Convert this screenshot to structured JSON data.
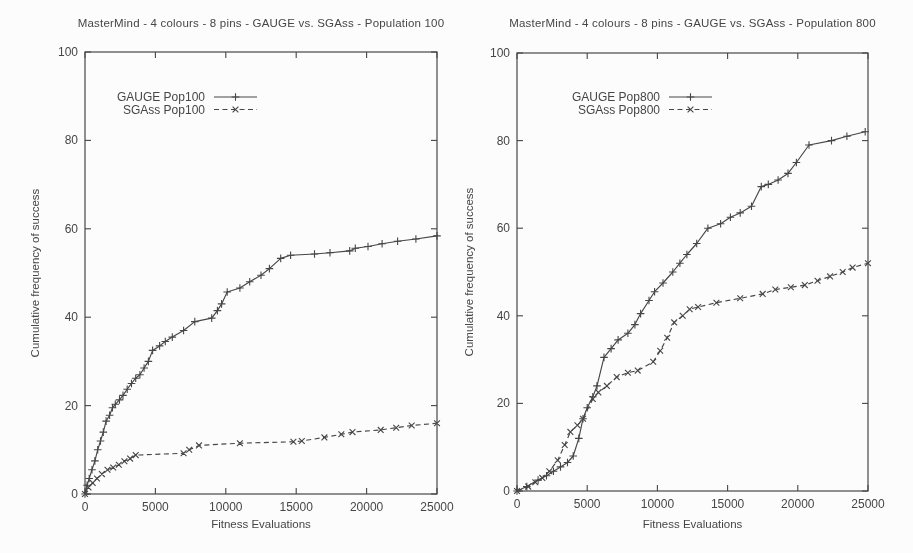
{
  "page": {
    "background": "#fcfcfc",
    "ink": "#464646"
  },
  "chart_data": [
    {
      "type": "line",
      "title": "MasterMind - 4 colours - 8 pins - GAUGE vs. SGAss - Population 100",
      "xlabel": "Fitness Evaluations",
      "ylabel": "Cumulative frequency of success",
      "xlim": [
        0,
        25000
      ],
      "ylim": [
        0,
        100
      ],
      "xticks": [
        0,
        5000,
        10000,
        15000,
        20000,
        25000
      ],
      "xtick_labels": [
        "0",
        "5000",
        "10000",
        "15000",
        "20000",
        "25000"
      ],
      "yticks": [
        0,
        20,
        40,
        60,
        80,
        100
      ],
      "ytick_labels": [
        "0",
        "20",
        "40",
        "60",
        "80",
        "100"
      ],
      "grid": false,
      "legend_position": "top-left-inside",
      "series": [
        {
          "name": "GAUGE Pop100",
          "line_style": "solid",
          "marker": "plus",
          "points": [
            [
              0,
              0
            ],
            [
              150,
              2
            ],
            [
              300,
              3.5
            ],
            [
              500,
              5.5
            ],
            [
              700,
              7.5
            ],
            [
              900,
              10
            ],
            [
              1100,
              12
            ],
            [
              1300,
              14
            ],
            [
              1500,
              16.5
            ],
            [
              1750,
              17.8
            ],
            [
              1950,
              19.5
            ],
            [
              2150,
              20.3
            ],
            [
              2450,
              21.3
            ],
            [
              2700,
              22.3
            ],
            [
              3000,
              23.7
            ],
            [
              3300,
              25
            ],
            [
              3600,
              26.2
            ],
            [
              3900,
              27
            ],
            [
              4200,
              28.5
            ],
            [
              4500,
              30
            ],
            [
              4800,
              32.5
            ],
            [
              5300,
              33.5
            ],
            [
              5700,
              34.5
            ],
            [
              6200,
              35.5
            ],
            [
              7000,
              37
            ],
            [
              7800,
              39
            ],
            [
              9000,
              39.8
            ],
            [
              9400,
              41.5
            ],
            [
              9700,
              43
            ],
            [
              10100,
              45.7
            ],
            [
              11000,
              46.6
            ],
            [
              11700,
              48
            ],
            [
              12500,
              49.5
            ],
            [
              13100,
              51
            ],
            [
              13900,
              53.3
            ],
            [
              14600,
              54
            ],
            [
              16300,
              54.3
            ],
            [
              17400,
              54.6
            ],
            [
              18800,
              55
            ],
            [
              19200,
              55.6
            ],
            [
              20100,
              56
            ],
            [
              21100,
              56.6
            ],
            [
              22200,
              57.2
            ],
            [
              23500,
              57.7
            ],
            [
              25000,
              58.4
            ]
          ]
        },
        {
          "name": "SGAss Pop100",
          "line_style": "dashed",
          "marker": "cross",
          "points": [
            [
              0,
              0
            ],
            [
              250,
              1.5
            ],
            [
              550,
              2.5
            ],
            [
              850,
              3.5
            ],
            [
              1200,
              4.5
            ],
            [
              1600,
              5.5
            ],
            [
              2000,
              6
            ],
            [
              2400,
              6.6
            ],
            [
              2800,
              7.4
            ],
            [
              3200,
              8
            ],
            [
              3600,
              8.8
            ],
            [
              7000,
              9.2
            ],
            [
              7400,
              10
            ],
            [
              8100,
              11
            ],
            [
              11000,
              11.5
            ],
            [
              14800,
              11.8
            ],
            [
              15400,
              12
            ],
            [
              17000,
              12.8
            ],
            [
              18200,
              13.5
            ],
            [
              19000,
              14
            ],
            [
              21000,
              14.5
            ],
            [
              22100,
              15
            ],
            [
              23200,
              15.5
            ],
            [
              25000,
              16
            ]
          ]
        }
      ]
    },
    {
      "type": "line",
      "title": "MasterMind - 4 colours - 8 pins - GAUGE vs. SGAss - Population 800",
      "xlabel": "Fitness Evaluations",
      "ylabel": "Cumulative frequency of success",
      "xlim": [
        0,
        25000
      ],
      "ylim": [
        0,
        100
      ],
      "xticks": [
        0,
        5000,
        10000,
        15000,
        20000,
        25000
      ],
      "xtick_labels": [
        "0",
        "5000",
        "10000",
        "15000",
        "20000",
        "25000"
      ],
      "yticks": [
        0,
        20,
        40,
        60,
        80,
        100
      ],
      "ytick_labels": [
        "0",
        "20",
        "40",
        "60",
        "80",
        "100"
      ],
      "grid": false,
      "legend_position": "top-left-inside",
      "series": [
        {
          "name": "GAUGE Pop800",
          "line_style": "solid",
          "marker": "plus",
          "points": [
            [
              0,
              0
            ],
            [
              700,
              1
            ],
            [
              1500,
              2.5
            ],
            [
              2100,
              3.5
            ],
            [
              2600,
              4.5
            ],
            [
              3100,
              5.5
            ],
            [
              3600,
              6.5
            ],
            [
              4000,
              8
            ],
            [
              4400,
              12
            ],
            [
              4700,
              16.5
            ],
            [
              5000,
              19
            ],
            [
              5400,
              21.5
            ],
            [
              5700,
              24
            ],
            [
              6200,
              30.5
            ],
            [
              6700,
              32.5
            ],
            [
              7200,
              34.5
            ],
            [
              7900,
              36
            ],
            [
              8400,
              38
            ],
            [
              8800,
              40.5
            ],
            [
              9400,
              43.5
            ],
            [
              9800,
              45.5
            ],
            [
              10400,
              47.5
            ],
            [
              11100,
              50
            ],
            [
              11600,
              52
            ],
            [
              12100,
              54
            ],
            [
              12800,
              56.5
            ],
            [
              13600,
              60
            ],
            [
              14500,
              61
            ],
            [
              15200,
              62.5
            ],
            [
              15900,
              63.5
            ],
            [
              16700,
              65
            ],
            [
              17400,
              69.5
            ],
            [
              17900,
              70
            ],
            [
              18600,
              71
            ],
            [
              19300,
              72.5
            ],
            [
              19900,
              75
            ],
            [
              20800,
              79
            ],
            [
              22400,
              80
            ],
            [
              23500,
              81
            ],
            [
              24800,
              82
            ]
          ]
        },
        {
          "name": "SGAss Pop800",
          "line_style": "dashed",
          "marker": "cross",
          "points": [
            [
              0,
              0
            ],
            [
              800,
              1
            ],
            [
              1300,
              2
            ],
            [
              1800,
              3
            ],
            [
              2300,
              4.5
            ],
            [
              2900,
              7
            ],
            [
              3400,
              10.5
            ],
            [
              3800,
              13.5
            ],
            [
              4300,
              15
            ],
            [
              4700,
              16.5
            ],
            [
              5400,
              21
            ],
            [
              5800,
              22.5
            ],
            [
              6400,
              24
            ],
            [
              7100,
              26
            ],
            [
              7900,
              27
            ],
            [
              8600,
              27.5
            ],
            [
              9700,
              29.5
            ],
            [
              10200,
              32
            ],
            [
              10700,
              35
            ],
            [
              11200,
              38.5
            ],
            [
              11800,
              40
            ],
            [
              12300,
              41.5
            ],
            [
              12900,
              42
            ],
            [
              14200,
              43
            ],
            [
              15900,
              44
            ],
            [
              17500,
              45
            ],
            [
              18400,
              46
            ],
            [
              19500,
              46.5
            ],
            [
              20500,
              47
            ],
            [
              21400,
              48
            ],
            [
              22300,
              49
            ],
            [
              23200,
              50
            ],
            [
              23900,
              51
            ],
            [
              25000,
              52
            ]
          ]
        }
      ]
    }
  ]
}
